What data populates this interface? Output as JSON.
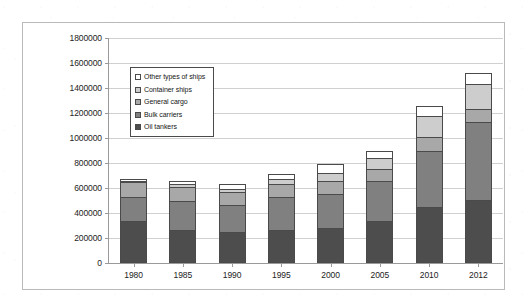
{
  "chart_data": {
    "type": "bar",
    "subtype": "stacked-column",
    "title": "",
    "xlabel": "",
    "ylabel": "",
    "categories": [
      "1980",
      "1985",
      "1990",
      "1995",
      "2000",
      "2005",
      "2010",
      "2012"
    ],
    "ylim": [
      0,
      1800000
    ],
    "ytick_step": 200000,
    "ytick_labels": [
      "1800000",
      "1600000",
      "1400000",
      "1200000",
      "1000000",
      "800000",
      "600000",
      "400000",
      "200000",
      "0"
    ],
    "ytick_values": [
      1800000,
      1600000,
      1400000,
      1200000,
      1000000,
      800000,
      600000,
      400000,
      200000,
      0
    ],
    "grid": true,
    "legend_position": "inside-upper-left",
    "series": [
      {
        "name": "Oil tankers",
        "color": "#4d4d4d",
        "values": [
          340000,
          265000,
          245000,
          265000,
          280000,
          335000,
          450000,
          505000
        ]
      },
      {
        "name": "Bulk carriers",
        "color": "#808080",
        "values": [
          190000,
          235000,
          220000,
          260000,
          275000,
          320000,
          450000,
          625000
        ]
      },
      {
        "name": "General cargo",
        "color": "#a8a8a8",
        "values": [
          115000,
          110000,
          100000,
          105000,
          100000,
          95000,
          110000,
          100000
        ]
      },
      {
        "name": "Container ships",
        "color": "#cdcdcd",
        "values": [
          10000,
          20000,
          25000,
          40000,
          65000,
          90000,
          170000,
          200000
        ]
      },
      {
        "name": "Other types of ships",
        "color": "#ffffff",
        "values": [
          20000,
          30000,
          40000,
          40000,
          75000,
          55000,
          75000,
          90000
        ]
      }
    ],
    "totals": [
      675000,
      660000,
      630000,
      710000,
      795000,
      895000,
      1255000,
      1520000
    ],
    "legend_order": [
      "Other types of ships",
      "Container ships",
      "General cargo",
      "Bulk carriers",
      "Oil tankers"
    ]
  }
}
